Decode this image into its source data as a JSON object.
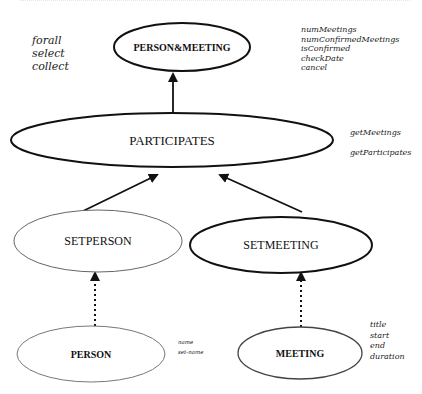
{
  "diagram": {
    "nodes": [
      {
        "id": "person_meeting",
        "label": "PERSON&MEETING",
        "cx": 182,
        "cy": 47,
        "rx": 68,
        "ry": 24,
        "stroke": "#111111",
        "stroke_width": 2,
        "font_size": 10,
        "bold": true
      },
      {
        "id": "participates",
        "label": "PARTICIPATES",
        "cx": 172,
        "cy": 140,
        "rx": 161,
        "ry": 27,
        "stroke": "#111111",
        "stroke_width": 2,
        "font_size": 13,
        "bold": false
      },
      {
        "id": "setperson",
        "label": "SETPERSON",
        "cx": 98,
        "cy": 241,
        "rx": 84,
        "ry": 31,
        "stroke": "#666666",
        "stroke_width": 1,
        "font_size": 12,
        "bold": false
      },
      {
        "id": "setmeeting",
        "label": "SETMEETING",
        "cx": 281,
        "cy": 245,
        "rx": 91,
        "ry": 28,
        "stroke": "#111111",
        "stroke_width": 2,
        "font_size": 12,
        "bold": false
      },
      {
        "id": "person",
        "label": "PERSON",
        "cx": 91,
        "cy": 354,
        "rx": 74,
        "ry": 28,
        "stroke": "#777777",
        "stroke_width": 1,
        "font_size": 10,
        "bold": true
      },
      {
        "id": "meeting",
        "label": "MEETING",
        "cx": 300,
        "cy": 353,
        "rx": 62,
        "ry": 26,
        "stroke": "#444444",
        "stroke_width": 1.3,
        "font_size": 10,
        "bold": true
      }
    ],
    "edges": [
      {
        "from": "participates",
        "to": "person_meeting",
        "style": "solid",
        "x1": 173,
        "y1": 112,
        "x2": 173,
        "y2": 74
      },
      {
        "from": "setperson",
        "to": "participates",
        "style": "solid",
        "x1": 79,
        "y1": 213,
        "x2": 157,
        "y2": 175
      },
      {
        "from": "setmeeting",
        "to": "participates",
        "style": "solid",
        "x1": 302,
        "y1": 212,
        "x2": 220,
        "y2": 175
      },
      {
        "from": "person",
        "to": "setperson",
        "style": "dotted",
        "x1": 95,
        "y1": 326,
        "x2": 95,
        "y2": 273
      },
      {
        "from": "meeting",
        "to": "setmeeting",
        "style": "dotted",
        "x1": 301,
        "y1": 327,
        "x2": 301,
        "y2": 273
      }
    ],
    "annotations": [
      {
        "id": "collection-ops",
        "lines": [
          "forall",
          "select",
          "collect"
        ],
        "x": 32,
        "y": 44,
        "font_size": 11,
        "line_height": 13
      },
      {
        "id": "person-meeting-ops",
        "lines": [
          "numMeetings",
          "numConfirmedMeetings",
          "isConfirmed",
          "checkDate",
          "cancel"
        ],
        "x": 301,
        "y": 32,
        "font_size": 8,
        "line_height": 9.5
      },
      {
        "id": "participates-ops",
        "lines": [
          "getMeetings",
          "getParticipates"
        ],
        "x": 350,
        "y": 135,
        "font_size": 8,
        "line_height": 20
      },
      {
        "id": "person-ops",
        "lines": [
          "name",
          "set-name"
        ],
        "x": 178,
        "y": 344,
        "font_size": 5.5,
        "line_height": 10
      },
      {
        "id": "meeting-ops",
        "lines": [
          "title",
          "start",
          "end",
          "duration"
        ],
        "x": 370,
        "y": 327,
        "font_size": 8,
        "line_height": 10.5
      }
    ]
  }
}
